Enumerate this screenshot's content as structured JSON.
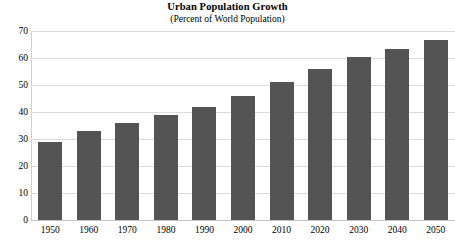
{
  "chart_data": {
    "type": "bar",
    "title": "Urban Population Growth",
    "subtitle": "(Percent of World Population)",
    "xlabel": "",
    "ylabel": "",
    "categories": [
      "1950",
      "1960",
      "1970",
      "1980",
      "1990",
      "2000",
      "2010",
      "2020",
      "2030",
      "2040",
      "2050"
    ],
    "values": [
      29,
      33,
      36,
      39,
      42,
      46,
      51,
      56,
      60.5,
      63.5,
      66.5
    ],
    "ylim": [
      0,
      70
    ],
    "yticks": [
      0,
      10,
      20,
      30,
      40,
      50,
      60,
      70
    ],
    "ytick_labels": [
      "0",
      "10",
      "20",
      "30",
      "40",
      "50",
      "60",
      "70"
    ],
    "grid": true,
    "legend": false,
    "bar_color": "#545454",
    "grid_color": "#dcdcdc",
    "background_color": "#ffffff"
  }
}
